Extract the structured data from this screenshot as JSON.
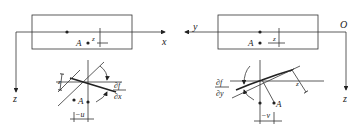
{
  "left_panel": {
    "axis_x_label": "x",
    "axis_z_label": "z",
    "point_label": "A",
    "offset_label": "z",
    "slope_label_num": "∂f",
    "slope_label_den": "∂x",
    "dist_label": "z",
    "disp_label": "−u"
  },
  "right_panel": {
    "axis_y_label": "y",
    "origin_label": "O",
    "axis_z_label": "z",
    "point_label": "A",
    "offset_label": "z",
    "slope_label_num": "∂f",
    "slope_label_den": "∂y",
    "dist_label": "z",
    "disp_label": "−v"
  },
  "colors": {
    "ink": "#222222",
    "background": "#ffffff"
  }
}
